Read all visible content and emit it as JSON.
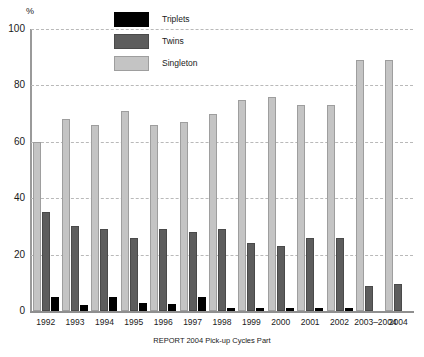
{
  "chart_data": {
    "type": "bar",
    "title": "",
    "subtitle": "",
    "caption": "REPORT 2004 Pick-up Cycles Part",
    "xlabel": "",
    "ylabel": "%",
    "ylim": [
      0,
      100
    ],
    "yticks": [
      0,
      20,
      40,
      60,
      80,
      100
    ],
    "ytick_labels": [
      "0",
      "20",
      "40",
      "60",
      "80",
      "100"
    ],
    "grid": true,
    "gridlines_at": [
      20,
      40,
      60,
      80,
      100
    ],
    "legend_position": "top-center",
    "categories": [
      "1992",
      "1993",
      "1994",
      "1995",
      "1996",
      "1997",
      "1998",
      "1999",
      "2000",
      "2001",
      "2002",
      "2003–2004",
      "2004"
    ],
    "series": [
      {
        "name": "Singleton",
        "color": "#c4c4c4",
        "values": [
          60,
          68,
          66,
          71,
          66,
          67,
          70,
          75,
          76,
          73,
          73,
          89,
          89
        ]
      },
      {
        "name": "Twins",
        "color": "#5d5d5d",
        "values": [
          35,
          30,
          29,
          26,
          29,
          28,
          29,
          24,
          23,
          26,
          26,
          9,
          9.5
        ]
      },
      {
        "name": "Triplets",
        "color": "#000000",
        "values": [
          5,
          2,
          5,
          3,
          2.5,
          5,
          1,
          1,
          1,
          1.2,
          1,
          0,
          0
        ]
      }
    ],
    "bar_order_in_group": [
      "Singleton",
      "Twins",
      "Triplets"
    ]
  },
  "legend": {
    "items": [
      {
        "label": "Triplets",
        "swatch": "legend-swatch-triplets"
      },
      {
        "label": "Twins",
        "swatch": "legend-swatch-twins"
      },
      {
        "label": "Singleton",
        "swatch": "legend-swatch-singleton"
      }
    ]
  }
}
